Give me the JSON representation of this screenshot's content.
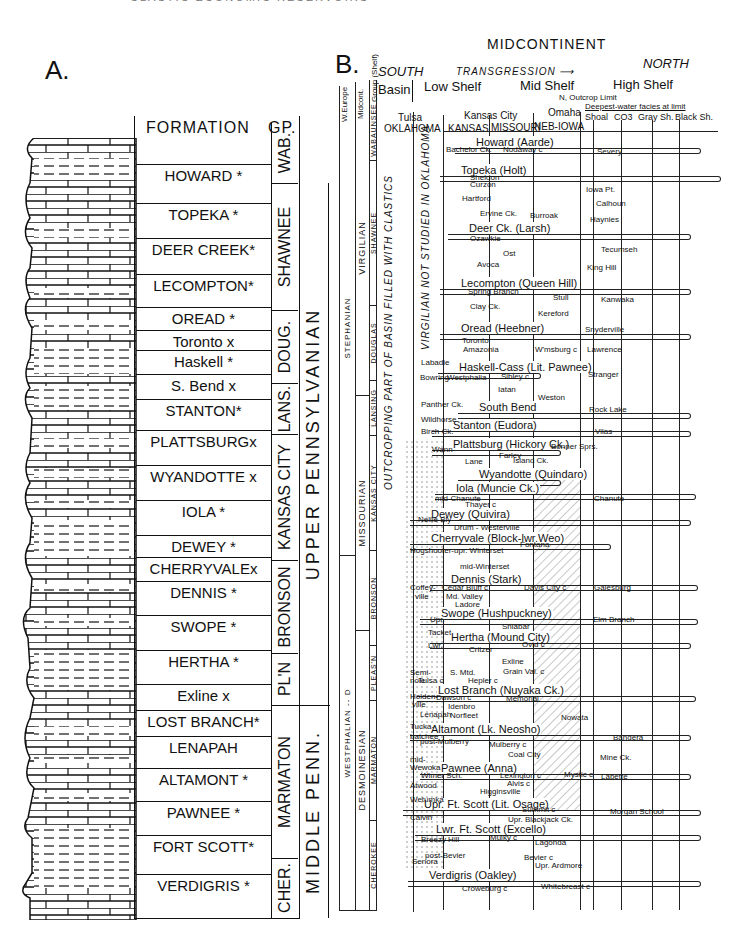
{
  "header_fragment": "CLASTIC ECONOMIC RESERVOIRS",
  "panel_a": {
    "label": "A.",
    "col_formation": "FORMATION",
    "col_group": "GP.",
    "formations": [
      {
        "name": "HOWARD *",
        "y": 176
      },
      {
        "name": "TOPEKA *",
        "y": 215
      },
      {
        "name": "DEER CREEK*",
        "y": 250
      },
      {
        "name": "LECOMPTON*",
        "y": 286
      },
      {
        "name": "OREAD *",
        "y": 319
      },
      {
        "name": "Toronto x",
        "y": 342
      },
      {
        "name": "Haskell *",
        "y": 362
      },
      {
        "name": "S. Bend x",
        "y": 386
      },
      {
        "name": "STANTON*",
        "y": 411
      },
      {
        "name": "PLATTSBURGx",
        "y": 442
      },
      {
        "name": "WYANDOTTE x",
        "y": 477
      },
      {
        "name": "IOLA *",
        "y": 512
      },
      {
        "name": "DEWEY *",
        "y": 547
      },
      {
        "name": "CHERRYVALEx",
        "y": 569
      },
      {
        "name": "DENNIS *",
        "y": 593
      },
      {
        "name": "SWOPE *",
        "y": 627
      },
      {
        "name": "HERTHA *",
        "y": 662
      },
      {
        "name": "Exline x",
        "y": 696
      },
      {
        "name": "LOST BRANCH*",
        "y": 722
      },
      {
        "name": "LENAPAH",
        "y": 748
      },
      {
        "name": "ALTAMONT *",
        "y": 780
      },
      {
        "name": "PAWNEE *",
        "y": 813
      },
      {
        "name": "FORT SCOTT*",
        "y": 847
      },
      {
        "name": "VERDIGRIS *",
        "y": 886
      }
    ],
    "groups": [
      {
        "name": "WAB.",
        "top": 123,
        "h": 60
      },
      {
        "name": "SHAWNEE",
        "top": 183,
        "h": 127
      },
      {
        "name": "DOUG.",
        "top": 310,
        "h": 73
      },
      {
        "name": "LANS.",
        "top": 383,
        "h": 51
      },
      {
        "name": "KANSAS CITY",
        "top": 434,
        "h": 126
      },
      {
        "name": "BRONSON",
        "top": 560,
        "h": 93
      },
      {
        "name": "PL'N",
        "top": 653,
        "h": 52
      },
      {
        "name": "MARMATON",
        "top": 705,
        "h": 153
      },
      {
        "name": "CHER.",
        "top": 858,
        "h": 60
      }
    ],
    "series": [
      {
        "name": "UPPER PENNSYLVANIAN",
        "top": 183,
        "h": 522
      },
      {
        "name": "MIDDLE PENN.",
        "top": 705,
        "h": 213
      }
    ]
  },
  "panel_b": {
    "label": "B.",
    "title": "MIDCONTINENT",
    "south": "SOUTH",
    "north": "NORTH",
    "transgression": "TRANSGRESSION",
    "zones": [
      "Basin",
      "Low Shelf",
      "Mid Shelf",
      "High Shelf"
    ],
    "outcrop_limit": "N, Outcrop Limit",
    "deepest_facies": "Deepest-water facies at limit",
    "facies_cols": [
      "Shoal",
      "CO3",
      "Gray Sh.",
      "Black Sh."
    ],
    "cities": [
      "Tulsa",
      "Kansas City",
      "Omaha"
    ],
    "states": [
      "OKLAHOMA",
      "KANSAS",
      "MISSOURI",
      "NEB-IOWA"
    ],
    "col_headers": [
      "W.Europe",
      "Midcont.",
      "Group (Shelf)"
    ],
    "europe": [
      {
        "name": "STEPHANIAN",
        "top": 100,
        "h": 455
      },
      {
        "name": "WESTPHALIAN -- D",
        "top": 555,
        "h": 355
      }
    ],
    "midcont": [
      {
        "name": "VIRGILIAN",
        "top": 100,
        "h": 295
      },
      {
        "name": "MISSOURIAN",
        "top": 395,
        "h": 235
      },
      {
        "name": "DESMOINESIAN",
        "top": 630,
        "h": 280
      }
    ],
    "groups": [
      {
        "name": "WABAUNSEE",
        "top": 100,
        "h": 60
      },
      {
        "name": "SHAWNEE",
        "top": 160,
        "h": 145
      },
      {
        "name": "DOUGLAS",
        "top": 305,
        "h": 75
      },
      {
        "name": "LANSING",
        "top": 380,
        "h": 55
      },
      {
        "name": "KANSAS CITY",
        "top": 435,
        "h": 115
      },
      {
        "name": "BRONSON",
        "top": 550,
        "h": 95
      },
      {
        "name": "PLEAS'N",
        "top": 645,
        "h": 55
      },
      {
        "name": "MARMATON",
        "top": 700,
        "h": 120
      },
      {
        "name": "CHEROKEE",
        "top": 820,
        "h": 90
      }
    ],
    "oklahoma_notes": [
      "OUTCROPPING PART OF BASIN FILLED WITH CLASTICS",
      "VIRGILIAN NOT STUDIED IN OKLAHOMA"
    ],
    "cyclothems": [
      {
        "name": "Howard (Aarde)",
        "y": 142,
        "x": 475,
        "tip": 700
      },
      {
        "name": "Topeka (Holt)",
        "y": 170,
        "x": 460,
        "tip": 720
      },
      {
        "name": "Deer Ck. (Larsh)",
        "y": 228,
        "x": 468,
        "tip": 690
      },
      {
        "name": "Lecompton (Queen Hill)",
        "y": 283,
        "x": 460,
        "tip": 690
      },
      {
        "name": "Oread (Heebner)",
        "y": 328,
        "x": 460,
        "tip": 690
      },
      {
        "name": "Haskell-Cass (Lit. Pawnee)",
        "y": 367,
        "x": 458,
        "tip": 540
      },
      {
        "name": "South Bend",
        "y": 407,
        "x": 478,
        "tip": 690
      },
      {
        "name": "Stanton (Eudora)",
        "y": 425,
        "x": 452,
        "tip": 690
      },
      {
        "name": "Plattsburg (Hickory Ck.)",
        "y": 444,
        "x": 452,
        "tip": 560
      },
      {
        "name": "Wyandotte (Quindaro)",
        "y": 474,
        "x": 478,
        "tip": 560
      },
      {
        "name": "Iola (Muncie Ck.)",
        "y": 488,
        "x": 455,
        "tip": 695
      },
      {
        "name": "Dewey (Quivira)",
        "y": 514,
        "x": 430,
        "tip": 690
      },
      {
        "name": "Cherryvale (Block-lwr.Weo)",
        "y": 538,
        "x": 430,
        "tip": 610
      },
      {
        "name": "Dennis (Stark)",
        "y": 579,
        "x": 450,
        "tip": 697
      },
      {
        "name": "Swope (Hushpuckney)",
        "y": 613,
        "x": 440,
        "tip": 697
      },
      {
        "name": "Hertha (Mound City)",
        "y": 637,
        "x": 450,
        "tip": 690
      },
      {
        "name": "Lost Branch (Nuyaka Ck.)",
        "y": 690,
        "x": 437,
        "tip": 695
      },
      {
        "name": "Altamont (Lk. Neosho)",
        "y": 729,
        "x": 430,
        "tip": 690
      },
      {
        "name": "Pawnee (Anna)",
        "y": 768,
        "x": 440,
        "tip": 690
      },
      {
        "name": "Upr. Ft. Scott (Lit. Osage)",
        "y": 804,
        "x": 423,
        "tip": 700
      },
      {
        "name": "Lwr. Ft. Scott (Excello)",
        "y": 829,
        "x": 435,
        "tip": 700
      },
      {
        "name": "Verdigris (Oakley)",
        "y": 875,
        "x": 428,
        "tip": 700
      }
    ],
    "minor_labels": [
      {
        "t": "Nodaway c",
        "x": 503,
        "y": 150
      },
      {
        "t": "Bachelor Ck.",
        "x": 446,
        "y": 150
      },
      {
        "t": "Severy",
        "x": 597,
        "y": 152
      },
      {
        "t": "Sheldon",
        "x": 470,
        "y": 178
      },
      {
        "t": "Curzon",
        "x": 470,
        "y": 185
      },
      {
        "t": "Iowa Pt.",
        "x": 586,
        "y": 190
      },
      {
        "t": "Hartford",
        "x": 462,
        "y": 199
      },
      {
        "t": "Calhoun",
        "x": 596,
        "y": 204
      },
      {
        "t": "Ervine Ck.",
        "x": 480,
        "y": 214
      },
      {
        "t": "Burroak",
        "x": 530,
        "y": 216
      },
      {
        "t": "Haynies",
        "x": 590,
        "y": 220
      },
      {
        "t": "Ozawkie",
        "x": 470,
        "y": 239
      },
      {
        "t": "Tecumseh",
        "x": 601,
        "y": 250
      },
      {
        "t": "Ost",
        "x": 503,
        "y": 254
      },
      {
        "t": "Avoca",
        "x": 477,
        "y": 265
      },
      {
        "t": "King Hill",
        "x": 587,
        "y": 268
      },
      {
        "t": "Spring Branch",
        "x": 468,
        "y": 292
      },
      {
        "t": "Stull",
        "x": 553,
        "y": 298
      },
      {
        "t": "Kanwaka",
        "x": 601,
        "y": 300
      },
      {
        "t": "Clay Ck.",
        "x": 470,
        "y": 307
      },
      {
        "t": "Kereford",
        "x": 538,
        "y": 314
      },
      {
        "t": "Snyderville",
        "x": 585,
        "y": 330
      },
      {
        "t": "Toronto",
        "x": 462,
        "y": 341
      },
      {
        "t": "Amazonia",
        "x": 463,
        "y": 350
      },
      {
        "t": "W'msburg c",
        "x": 535,
        "y": 350
      },
      {
        "t": "Lawrence",
        "x": 587,
        "y": 350
      },
      {
        "t": "Labadie",
        "x": 421,
        "y": 363
      },
      {
        "t": "Stranger",
        "x": 588,
        "y": 375
      },
      {
        "t": "Bowring",
        "x": 420,
        "y": 378
      },
      {
        "t": "Westphalia",
        "x": 447,
        "y": 378
      },
      {
        "t": "Sibley c",
        "x": 501,
        "y": 377
      },
      {
        "t": "Iatan",
        "x": 498,
        "y": 390
      },
      {
        "t": "Weston",
        "x": 538,
        "y": 398
      },
      {
        "t": "Rock Lake",
        "x": 589,
        "y": 410
      },
      {
        "t": "Panther Ck.",
        "x": 421,
        "y": 405
      },
      {
        "t": "Wildhorse",
        "x": 421,
        "y": 420
      },
      {
        "t": "Birch Ck.",
        "x": 421,
        "y": 432
      },
      {
        "t": "Vilas",
        "x": 595,
        "y": 432
      },
      {
        "t": "Bonner Sprs.",
        "x": 551,
        "y": 447
      },
      {
        "t": "Wann",
        "x": 432,
        "y": 450
      },
      {
        "t": "Farley",
        "x": 499,
        "y": 456
      },
      {
        "t": "Lane",
        "x": 465,
        "y": 462
      },
      {
        "t": "Island Ck.",
        "x": 513,
        "y": 461
      },
      {
        "t": "mid-Chanute",
        "x": 435,
        "y": 499
      },
      {
        "t": "Thayer c",
        "x": 465,
        "y": 505
      },
      {
        "t": "Chanute",
        "x": 594,
        "y": 499
      },
      {
        "t": "Nellie Bly",
        "x": 418,
        "y": 520
      },
      {
        "t": "Drum - Westerville",
        "x": 454,
        "y": 528
      },
      {
        "t": "Fontana",
        "x": 520,
        "y": 545
      },
      {
        "t": "Hogshooter-upr. Winterset",
        "x": 410,
        "y": 551
      },
      {
        "t": "mid-Winterset",
        "x": 460,
        "y": 567
      },
      {
        "t": "Cedar Bluff c",
        "x": 442,
        "y": 588
      },
      {
        "t": "Davis City c",
        "x": 524,
        "y": 588
      },
      {
        "t": "Galesburg",
        "x": 594,
        "y": 588
      },
      {
        "t": "Coffey-",
        "x": 410,
        "y": 588
      },
      {
        "t": "ville",
        "x": 415,
        "y": 597
      },
      {
        "t": "Md. Valley",
        "x": 446,
        "y": 597
      },
      {
        "t": "Ladore",
        "x": 455,
        "y": 605
      },
      {
        "t": "Elm Branch",
        "x": 593,
        "y": 620
      },
      {
        "t": "Upr.",
        "x": 430,
        "y": 620
      },
      {
        "t": "Sniabar",
        "x": 502,
        "y": 627
      },
      {
        "t": "Tacket",
        "x": 428,
        "y": 633
      },
      {
        "t": "Lwr.",
        "x": 428,
        "y": 646
      },
      {
        "t": "Ovid c",
        "x": 522,
        "y": 645
      },
      {
        "t": "Critzer",
        "x": 469,
        "y": 650
      },
      {
        "t": "Exline",
        "x": 502,
        "y": 662
      },
      {
        "t": "S. Mtd.",
        "x": 450,
        "y": 673
      },
      {
        "t": "Grain Val. c",
        "x": 503,
        "y": 672
      },
      {
        "t": "Semi-",
        "x": 410,
        "y": 673
      },
      {
        "t": "nole",
        "x": 410,
        "y": 681
      },
      {
        "t": "Tulsa c",
        "x": 418,
        "y": 681
      },
      {
        "t": "Hepler c",
        "x": 468,
        "y": 681
      },
      {
        "t": "Dawson c",
        "x": 436,
        "y": 698
      },
      {
        "t": "Memorial",
        "x": 506,
        "y": 699
      },
      {
        "t": "Holden-",
        "x": 410,
        "y": 697
      },
      {
        "t": "ville",
        "x": 412,
        "y": 705
      },
      {
        "t": "Idenbro",
        "x": 448,
        "y": 707
      },
      {
        "t": "Lenapah",
        "x": 420,
        "y": 715
      },
      {
        "t": "Norfleet",
        "x": 450,
        "y": 716
      },
      {
        "t": "Nowata",
        "x": 561,
        "y": 718
      },
      {
        "t": "Tucka-",
        "x": 410,
        "y": 727
      },
      {
        "t": "batchee",
        "x": 410,
        "y": 737
      },
      {
        "t": "post-Mulberry",
        "x": 420,
        "y": 742
      },
      {
        "t": "Mulberry c",
        "x": 489,
        "y": 745
      },
      {
        "t": "Bandera",
        "x": 613,
        "y": 738
      },
      {
        "t": "Coal City",
        "x": 508,
        "y": 755
      },
      {
        "t": "Mine Ck.",
        "x": 600,
        "y": 758
      },
      {
        "t": "mid-",
        "x": 410,
        "y": 760
      },
      {
        "t": "Wewoka",
        "x": 410,
        "y": 768
      },
      {
        "t": "Wimer Sch.",
        "x": 421,
        "y": 776
      },
      {
        "t": "Lexington c",
        "x": 500,
        "y": 776
      },
      {
        "t": "Mystic c",
        "x": 564,
        "y": 775
      },
      {
        "t": "Labette",
        "x": 601,
        "y": 777
      },
      {
        "t": "Alvis c",
        "x": 507,
        "y": 784
      },
      {
        "t": "Atwood",
        "x": 410,
        "y": 786
      },
      {
        "t": "Higginsville",
        "x": 480,
        "y": 792
      },
      {
        "t": "Wetumka",
        "x": 410,
        "y": 800
      },
      {
        "t": "Summit c",
        "x": 522,
        "y": 810
      },
      {
        "t": "Morgan School",
        "x": 610,
        "y": 812
      },
      {
        "t": "Upr. Blackjack Ck.",
        "x": 508,
        "y": 820
      },
      {
        "t": "Calvin",
        "x": 410,
        "y": 818
      },
      {
        "t": "Breezy Hill",
        "x": 421,
        "y": 840
      },
      {
        "t": "Mulky c",
        "x": 490,
        "y": 838
      },
      {
        "t": "Lagonda",
        "x": 535,
        "y": 843
      },
      {
        "t": "post-Bevier",
        "x": 425,
        "y": 856
      },
      {
        "t": "Bevier c",
        "x": 524,
        "y": 858
      },
      {
        "t": "Senora",
        "x": 412,
        "y": 862
      },
      {
        "t": "Upr. Ardmore",
        "x": 535,
        "y": 866
      },
      {
        "t": "Croweburg c",
        "x": 462,
        "y": 889
      },
      {
        "t": "Whitebreast c",
        "x": 541,
        "y": 887
      }
    ],
    "north_labels_y": []
  }
}
